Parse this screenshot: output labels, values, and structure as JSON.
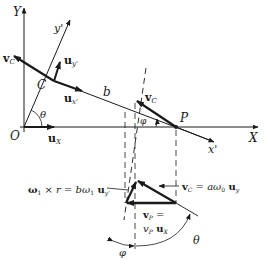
{
  "figure": {
    "labels": {
      "Y": "Y",
      "y_prime": "y'",
      "X": "X",
      "x_prime": "x'",
      "O": "O",
      "C": "C",
      "P": "P",
      "b": "b",
      "theta": "θ",
      "phi": "φ",
      "vC_top": "v",
      "vC_top_sub": "C",
      "vC_at_P": "v",
      "vC_at_P_sub": "C",
      "u_y_prime": "u",
      "u_y_prime_sub": "y'",
      "u_x_prime": "u",
      "u_x_prime_sub": "x'",
      "u_X": "u",
      "u_X_sub": "X"
    },
    "lower": {
      "omega_label_a": "ω",
      "omega_label_a_sub": "1",
      "omega_label_b": " × r = bω",
      "omega_label_b_sub": "1",
      "omega_label_c": " u",
      "omega_label_c_sub": "y'",
      "vC_eq_a": "v",
      "vC_eq_a_sub": "C",
      "vC_eq_b": " = aω",
      "vC_eq_b_sub": "0",
      "vC_eq_c": " u",
      "vC_eq_c_sub": "y",
      "vP_line1_a": "v",
      "vP_line1_sub": "P",
      "vP_line1_b": " =",
      "vP_line2_a": "v",
      "vP_line2_sub": "P",
      "vP_line2_b": " u",
      "vP_line2_sub2": "X",
      "theta": "θ",
      "phi": "φ"
    },
    "colors": {
      "ink": "#1a1a1a",
      "background": "#ffffff"
    }
  }
}
